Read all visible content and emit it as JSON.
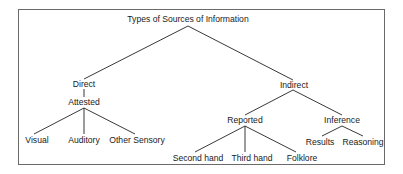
{
  "diagram": {
    "title": "Types of Sources of Information",
    "nodes": [
      {
        "id": "root",
        "label": "Types of Sources of Information",
        "x": 188,
        "y": 14
      },
      {
        "id": "direct",
        "label": "Direct",
        "x": 84,
        "y": 79
      },
      {
        "id": "attested",
        "label": "Attested",
        "x": 84,
        "y": 97
      },
      {
        "id": "visual",
        "label": "Visual",
        "x": 37,
        "y": 135
      },
      {
        "id": "auditory",
        "label": "Auditory",
        "x": 84,
        "y": 135
      },
      {
        "id": "other_sensory",
        "label": "Other Sensory",
        "x": 137,
        "y": 135
      },
      {
        "id": "indirect",
        "label": "Indirect",
        "x": 294,
        "y": 80
      },
      {
        "id": "reported",
        "label": "Reported",
        "x": 245,
        "y": 115
      },
      {
        "id": "inference",
        "label": "Inference",
        "x": 342,
        "y": 115
      },
      {
        "id": "second_hand",
        "label": "Second hand",
        "x": 198,
        "y": 153
      },
      {
        "id": "third_hand",
        "label": "Third hand",
        "x": 252,
        "y": 153
      },
      {
        "id": "folklore",
        "label": "Folklore",
        "x": 302,
        "y": 153
      },
      {
        "id": "results",
        "label": "Results",
        "x": 320,
        "y": 137
      },
      {
        "id": "reasoning",
        "label": "Reasoning",
        "x": 363,
        "y": 137
      }
    ],
    "edges": [
      {
        "from": [
          188,
          26
        ],
        "to": [
          84,
          79
        ]
      },
      {
        "from": [
          188,
          26
        ],
        "to": [
          293,
          80
        ]
      },
      {
        "from": [
          84,
          89
        ],
        "to": [
          84,
          97
        ]
      },
      {
        "from": [
          84,
          108
        ],
        "to": [
          34,
          134
        ]
      },
      {
        "from": [
          84,
          108
        ],
        "to": [
          84,
          134
        ]
      },
      {
        "from": [
          84,
          108
        ],
        "to": [
          135,
          134
        ]
      },
      {
        "from": [
          293,
          90
        ],
        "to": [
          245,
          115
        ]
      },
      {
        "from": [
          293,
          90
        ],
        "to": [
          342,
          115
        ]
      },
      {
        "from": [
          245,
          126
        ],
        "to": [
          195,
          152
        ]
      },
      {
        "from": [
          245,
          126
        ],
        "to": [
          245,
          152
        ]
      },
      {
        "from": [
          245,
          126
        ],
        "to": [
          296,
          152
        ]
      },
      {
        "from": [
          342,
          126
        ],
        "to": [
          322,
          136
        ]
      },
      {
        "from": [
          342,
          126
        ],
        "to": [
          363,
          136
        ]
      }
    ],
    "colors": {
      "line": "#222222",
      "frame": "#6a6a6a",
      "text": "#1a1a1a"
    }
  }
}
